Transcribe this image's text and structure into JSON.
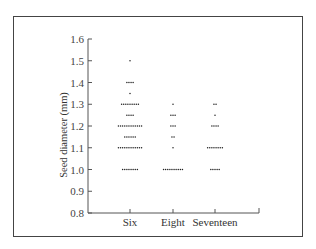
{
  "chart_data": {
    "type": "scatter",
    "subtype": "dot-plot",
    "title": "",
    "xlabel": "",
    "ylabel": "Seed diameter (mm)",
    "ylim": [
      0.8,
      1.6
    ],
    "yticks": [
      "0.8",
      "0.9",
      "1.0",
      "1.1",
      "1.2",
      "1.3",
      "1.4",
      "1.5",
      "1.6"
    ],
    "categories": [
      "Six",
      "Eight",
      "Seventeen"
    ],
    "grid": false,
    "legend": null,
    "series": [
      {
        "name": "Six",
        "points": [
          {
            "y": 1.0,
            "count": 8
          },
          {
            "y": 1.1,
            "count": 12
          },
          {
            "y": 1.15,
            "count": 6
          },
          {
            "y": 1.2,
            "count": 12
          },
          {
            "y": 1.25,
            "count": 4
          },
          {
            "y": 1.3,
            "count": 9
          },
          {
            "y": 1.35,
            "count": 1
          },
          {
            "y": 1.4,
            "count": 4
          },
          {
            "y": 1.5,
            "count": 1
          }
        ]
      },
      {
        "name": "Eight",
        "points": [
          {
            "y": 1.0,
            "count": 10
          },
          {
            "y": 1.1,
            "count": 1
          },
          {
            "y": 1.15,
            "count": 2
          },
          {
            "y": 1.2,
            "count": 3
          },
          {
            "y": 1.25,
            "count": 3
          },
          {
            "y": 1.3,
            "count": 1
          }
        ]
      },
      {
        "name": "Seventeen",
        "points": [
          {
            "y": 1.0,
            "count": 5
          },
          {
            "y": 1.1,
            "count": 8
          },
          {
            "y": 1.2,
            "count": 4
          },
          {
            "y": 1.25,
            "count": 1
          },
          {
            "y": 1.3,
            "count": 2
          }
        ]
      }
    ]
  }
}
